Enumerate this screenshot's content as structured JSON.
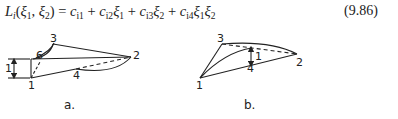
{
  "equation": {
    "lhs_func": "L",
    "lhs_sub": "i",
    "lhs_args_open": "(",
    "xi": "ξ",
    "sub1": "1",
    "sub2": "2",
    "comma": ", ",
    "close": ")",
    "eq": " = ",
    "c": "c",
    "plus": " + ",
    "c_subs": [
      "i1",
      "i2",
      "i3",
      "i4"
    ],
    "number": "(9.86)"
  },
  "figures": [
    {
      "caption": "a.",
      "node_labels": {
        "n1": "1",
        "n2": "2",
        "n3": "3",
        "n4": "4",
        "n6": "6"
      },
      "dimension_label": "1"
    },
    {
      "caption": "b.",
      "node_labels": {
        "n1": "1",
        "n2": "2",
        "n3": "3",
        "n4": "4"
      },
      "dimension_label": "1"
    }
  ]
}
